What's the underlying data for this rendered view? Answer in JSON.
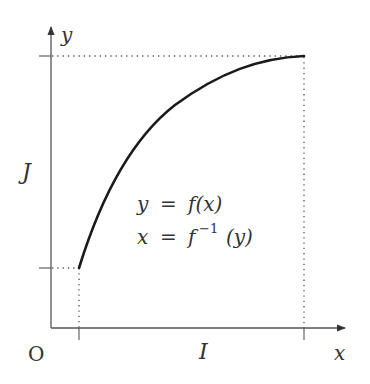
{
  "diagram": {
    "axes": {
      "x_label": "x",
      "y_label": "y",
      "origin_label": "O"
    },
    "interval_labels": {
      "domain": "I",
      "range": "J"
    },
    "equations": {
      "forward_lhs": "y",
      "forward_eq": "=",
      "forward_rhs": "f(x)",
      "inverse_lhs": "x",
      "inverse_eq": "=",
      "inverse_f": "f",
      "inverse_exp": "−1",
      "inverse_arg": "(y)"
    },
    "colors": {
      "axis": "#555555",
      "curve": "#1a1a1a",
      "dotted": "#555555",
      "text": "#333333"
    }
  }
}
